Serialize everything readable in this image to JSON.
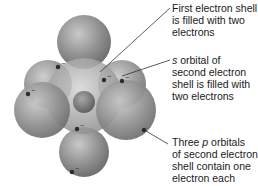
{
  "diagram": {
    "colors": {
      "orbital_fill": "#8a8a8a",
      "orbital_highlight": "#c8c8c8",
      "electron": "#2b2b2b",
      "leader_line": "#333333",
      "text": "#1a1a1a"
    },
    "labels": [
      {
        "id": "first-shell",
        "line1": "First electron shell",
        "line2": "is filled with two",
        "line3": "electrons"
      },
      {
        "id": "s-orbital",
        "italic_prefix": "s",
        "line1_rest": " orbital of",
        "line2": "second electron",
        "line3": "shell is filled with",
        "line4": "two electrons"
      },
      {
        "id": "p-orbitals",
        "line1_pre": "Three ",
        "italic_mid": "p",
        "line1_post": " orbitals",
        "line2": "of second electron",
        "line3": "shell contain one",
        "line4": "electron each"
      }
    ],
    "electron_symbol": "−"
  }
}
